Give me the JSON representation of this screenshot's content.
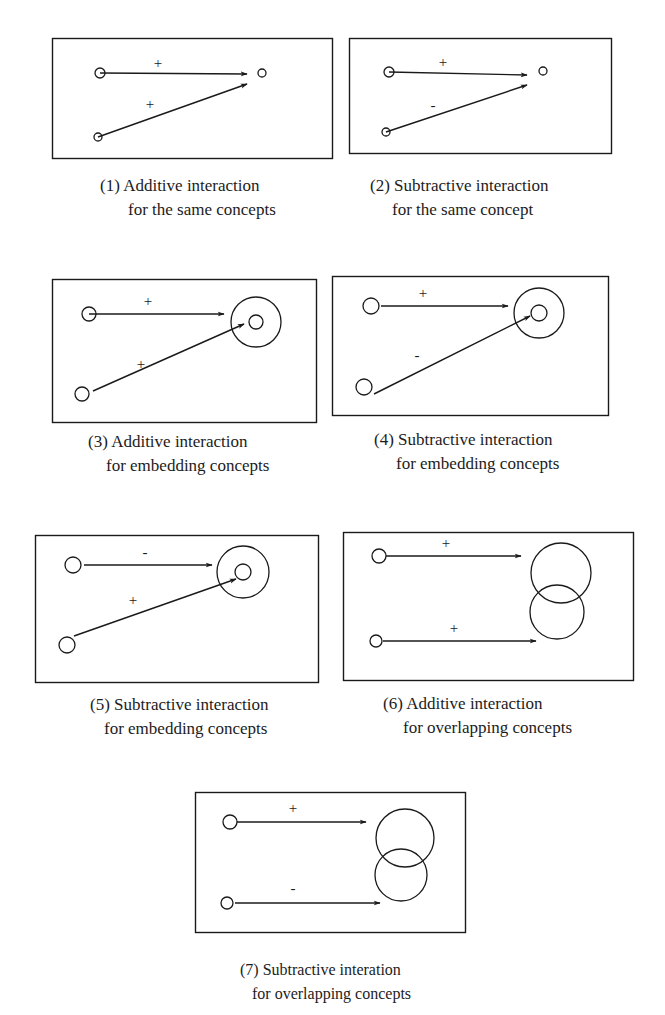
{
  "figure": {
    "panels": [
      {
        "id": 1,
        "caption": [
          "(1) Additive interaction",
          "for the same concepts"
        ],
        "box": [
          52,
          38,
          280,
          120
        ],
        "arrows": [
          {
            "from": [
              100,
              73
            ],
            "to": [
              247,
              74
            ],
            "sign": "+",
            "label_pos": [
              158,
              68
            ]
          },
          {
            "from": [
              98,
              137
            ],
            "to": [
              247,
              84
            ],
            "sign": "+",
            "label_pos": [
              150,
              109
            ]
          }
        ],
        "sources": [
          {
            "c": [
              100,
              73
            ],
            "r": 5
          },
          {
            "c": [
              98,
              137
            ],
            "r": 4
          }
        ],
        "targets": [
          {
            "c": [
              262,
              73
            ],
            "r": 4
          }
        ]
      },
      {
        "id": 2,
        "caption": [
          "(2) Subtractive interaction",
          "for the same concept"
        ],
        "box": [
          349,
          38,
          262,
          115
        ],
        "arrows": [
          {
            "from": [
              389,
              72
            ],
            "to": [
              527,
              75
            ],
            "sign": "+",
            "label_pos": [
              443,
              67
            ]
          },
          {
            "from": [
              386,
              132
            ],
            "to": [
              527,
              85
            ],
            "sign": "-",
            "label_pos": [
              433,
              110
            ]
          }
        ],
        "sources": [
          {
            "c": [
              389,
              72
            ],
            "r": 5
          },
          {
            "c": [
              386,
              132
            ],
            "r": 4
          }
        ],
        "targets": [
          {
            "c": [
              543,
              71
            ],
            "r": 4
          }
        ]
      },
      {
        "id": 3,
        "caption": [
          "(3) Additive interaction",
          "for embedding concepts"
        ],
        "box": [
          52,
          279,
          264,
          143
        ],
        "arrows": [
          {
            "from": [
              89,
              314
            ],
            "to": [
              224,
              314
            ],
            "sign": "+",
            "label_pos": [
              148,
              306
            ]
          },
          {
            "from": [
              93,
              391
            ],
            "to": [
              244,
              324
            ],
            "sign": "+",
            "label_pos": [
              141,
              369
            ]
          }
        ],
        "sources": [
          {
            "c": [
              89,
              314
            ],
            "r": 7
          },
          {
            "c": [
              82,
              394
            ],
            "r": 7
          }
        ],
        "targets": [
          {
            "c": [
              256,
              322
            ],
            "r": 7,
            "outer_r": 25
          }
        ]
      },
      {
        "id": 4,
        "caption": [
          "(4) Subtractive interaction",
          "for embedding concepts"
        ],
        "box": [
          332,
          276,
          276,
          139
        ],
        "arrows": [
          {
            "from": [
              381,
              306
            ],
            "to": [
              508,
              306
            ],
            "sign": "+",
            "label_pos": [
              423,
              298
            ]
          },
          {
            "from": [
              374,
              394
            ],
            "to": [
              530,
              316
            ],
            "sign": "-",
            "label_pos": [
              417,
              360
            ]
          }
        ],
        "sources": [
          {
            "c": [
              371,
              306
            ],
            "r": 8
          },
          {
            "c": [
              364,
              387
            ],
            "r": 8
          }
        ],
        "targets": [
          {
            "c": [
              539,
              313
            ],
            "r": 8,
            "outer_r": 25
          }
        ]
      },
      {
        "id": 5,
        "caption": [
          "(5) Subtractive interaction",
          "for embedding concepts"
        ],
        "box": [
          35,
          535,
          283,
          147
        ],
        "arrows": [
          {
            "from": [
              84,
              565
            ],
            "to": [
              212,
              565
            ],
            "sign": "-",
            "label_pos": [
              145,
              557
            ]
          },
          {
            "from": [
              74,
              636
            ],
            "to": [
              236,
              579
            ],
            "sign": "+",
            "label_pos": [
              133,
              605
            ]
          }
        ],
        "sources": [
          {
            "c": [
              73,
              565
            ],
            "r": 8
          },
          {
            "c": [
              67,
              645
            ],
            "r": 8
          }
        ],
        "targets": [
          {
            "c": [
              243,
              572
            ],
            "r": 8,
            "outer_r": 26
          }
        ]
      },
      {
        "id": 6,
        "caption": [
          "(6) Additive interaction",
          "for overlapping concepts"
        ],
        "box": [
          343,
          532,
          290,
          148
        ],
        "arrows": [
          {
            "from": [
              386,
              556
            ],
            "to": [
              521,
              556
            ],
            "sign": "+",
            "label_pos": [
              446,
              548
            ]
          },
          {
            "from": [
              383,
              641
            ],
            "to": [
              536,
              641
            ],
            "sign": "+",
            "label_pos": [
              454,
              633
            ]
          }
        ],
        "sources": [
          {
            "c": [
              379,
              556
            ],
            "r": 7
          },
          {
            "c": [
              376,
              641
            ],
            "r": 6
          }
        ],
        "overlap_targets": [
          {
            "c": [
              561,
              573
            ],
            "r": 30
          },
          {
            "c": [
              557,
              612
            ],
            "r": 27
          }
        ]
      },
      {
        "id": 7,
        "caption": [
          "(7) Subtractive interation",
          "for overlapping concepts"
        ],
        "box": [
          195,
          792,
          270,
          140
        ],
        "arrows": [
          {
            "from": [
              237,
              822
            ],
            "to": [
              366,
              822
            ],
            "sign": "+",
            "label_pos": [
              293,
              813
            ]
          },
          {
            "from": [
              235,
              903
            ],
            "to": [
              380,
              903
            ],
            "sign": "-",
            "label_pos": [
              293,
              893
            ]
          }
        ],
        "sources": [
          {
            "c": [
              230,
              822
            ],
            "r": 7
          },
          {
            "c": [
              227,
              903
            ],
            "r": 6
          }
        ],
        "overlap_targets": [
          {
            "c": [
              405,
              838
            ],
            "r": 29
          },
          {
            "c": [
              401,
              875
            ],
            "r": 26
          }
        ]
      }
    ],
    "caption_positions": [
      [
        100,
        174
      ],
      [
        370,
        174
      ],
      [
        88,
        430
      ],
      [
        374,
        428
      ],
      [
        90,
        693
      ],
      [
        383,
        692
      ],
      [
        240,
        958
      ]
    ],
    "caption_indents": [
      28,
      22,
      18,
      22,
      10,
      22,
      10
    ],
    "stroke_color": "#1a1a1a"
  }
}
